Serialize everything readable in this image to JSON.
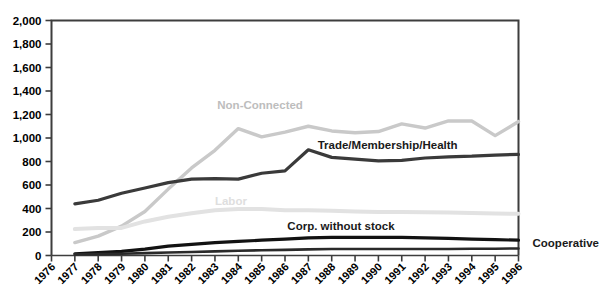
{
  "chart_data": {
    "type": "line",
    "title": "",
    "subtitle": "",
    "xlabel": "",
    "ylabel": "",
    "xlim": [
      1976,
      1996
    ],
    "ylim": [
      0,
      2000
    ],
    "grid": false,
    "legend_position": "inline-annotations",
    "x": [
      1976,
      1977,
      1978,
      1979,
      1980,
      1981,
      1982,
      1983,
      1984,
      1985,
      1986,
      1987,
      1988,
      1989,
      1990,
      1991,
      1992,
      1993,
      1994,
      1995,
      1996
    ],
    "ytick_labels": [
      "2,000",
      "1,800",
      "1,600",
      "1,400",
      "1,200",
      "1,000",
      "800",
      "600",
      "400",
      "200",
      "0"
    ],
    "ytick_values": [
      2000,
      1800,
      1600,
      1400,
      1200,
      1000,
      800,
      600,
      400,
      200,
      0
    ],
    "xtick_labels": [
      "1976",
      "1977",
      "1978",
      "1979",
      "1980",
      "1981",
      "1982",
      "1983",
      "1984",
      "1985",
      "1986",
      "1987",
      "1988",
      "1989",
      "1990",
      "1991",
      "1992",
      "1993",
      "1994",
      "1995",
      "1996"
    ],
    "series": [
      {
        "name": "Non-Connected",
        "label": "Non-Connected",
        "color": "#c9c9c9",
        "label_color": "#c4c4c4",
        "label_x": 1983.1,
        "label_y": 1250,
        "values": [
          null,
          110,
          165,
          250,
          375,
          565,
          745,
          895,
          1080,
          1010,
          1050,
          1100,
          1060,
          1045,
          1055,
          1120,
          1085,
          1145,
          1145,
          1020,
          1140
        ]
      },
      {
        "name": "Trade/Membership/Health",
        "label": "Trade/Membership/Health",
        "color": "#3a3a3a",
        "label_color": "#1a1a1a",
        "label_x": 1987.4,
        "label_y": 905,
        "values": [
          null,
          440,
          470,
          530,
          575,
          620,
          650,
          655,
          650,
          700,
          720,
          900,
          835,
          820,
          805,
          810,
          830,
          840,
          845,
          855,
          860
        ]
      },
      {
        "name": "Labor",
        "label": "Labor",
        "color": "#e2e2e2",
        "label_color": "#dcdcdc",
        "label_x": 1983.0,
        "label_y": 430,
        "values": [
          null,
          225,
          235,
          235,
          290,
          330,
          360,
          385,
          395,
          395,
          385,
          385,
          380,
          375,
          370,
          370,
          368,
          365,
          362,
          358,
          355
        ]
      },
      {
        "name": "Corp. without stock",
        "label": "Corp. without stock",
        "color": "#121212",
        "label_color": "#0a0a0a",
        "label_x": 1986.1,
        "label_y": 215,
        "values": [
          null,
          15,
          25,
          35,
          55,
          80,
          95,
          110,
          120,
          130,
          140,
          150,
          155,
          155,
          155,
          155,
          150,
          145,
          140,
          135,
          130
        ]
      },
      {
        "name": "Cooperative",
        "label": "Cooperative",
        "color": "#2a2a2a",
        "label_color": "#0a0a0a",
        "label_x": 1996.6,
        "label_y": 75,
        "values": [
          null,
          10,
          12,
          15,
          20,
          25,
          30,
          35,
          40,
          45,
          48,
          52,
          55,
          55,
          55,
          55,
          55,
          55,
          58,
          58,
          60
        ]
      }
    ]
  }
}
